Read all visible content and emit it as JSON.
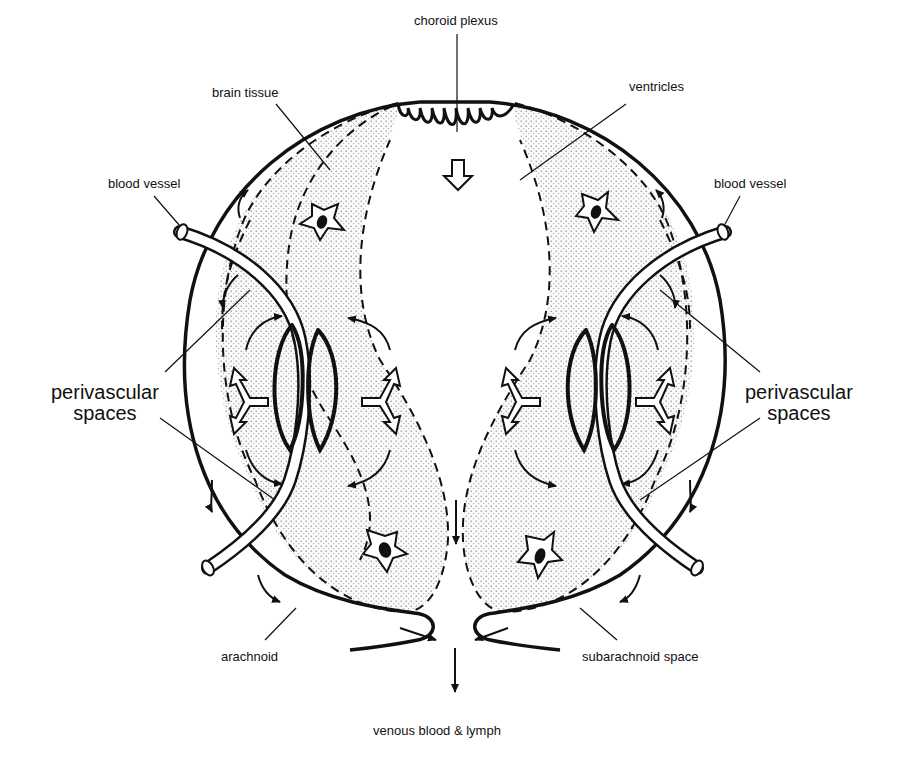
{
  "diagram": {
    "labels": {
      "choroid_plexus": "choroid plexus",
      "brain_tissue": "brain tissue",
      "ventricles": "ventricles",
      "blood_vessel_left": "blood vessel",
      "blood_vessel_right": "blood vessel",
      "perivascular_left_1": "perivascular",
      "perivascular_left_2": "spaces",
      "perivascular_right_1": "perivascular",
      "perivascular_right_2": "spaces",
      "arachnoid": "arachnoid",
      "subarachnoid_space": "subarachnoid space",
      "outflow": "venous blood & lymph"
    },
    "colors": {
      "ink": "#111111",
      "stipple": "#bdbdbd",
      "background": "#ffffff"
    }
  }
}
